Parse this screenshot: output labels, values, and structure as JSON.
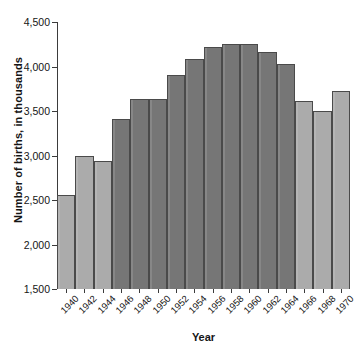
{
  "chart_data": {
    "type": "bar",
    "title": "",
    "xlabel": "Year",
    "ylabel": "Number of births, in thousands",
    "ylim": [
      1500,
      4500
    ],
    "ytick_labels": [
      "4,500",
      "4,000",
      "3,500",
      "3,000",
      "2,500",
      "2,000",
      "1,500"
    ],
    "ytick_values": [
      4500,
      4000,
      3500,
      3000,
      2500,
      2000,
      1500
    ],
    "grid": false,
    "legend": "none",
    "categories": [
      "1940",
      "1942",
      "1944",
      "1946",
      "1948",
      "1950",
      "1952",
      "1954",
      "1956",
      "1958",
      "1960",
      "1962",
      "1964",
      "1966",
      "1968",
      "1970"
    ],
    "values": [
      2560,
      2990,
      2940,
      3410,
      3640,
      3630,
      3910,
      4080,
      4220,
      4250,
      4250,
      4160,
      4030,
      3610,
      3500,
      3730
    ],
    "bar_shades": [
      "light",
      "light",
      "light",
      "dark",
      "dark",
      "dark",
      "dark",
      "dark",
      "dark",
      "dark",
      "dark",
      "dark",
      "dark",
      "light",
      "light",
      "light"
    ],
    "colors": {
      "bar_light": "#ababab",
      "bar_dark": "#767676",
      "bar_border": "#4a4a4a",
      "axis": "#3b3b3b",
      "text": "#151515",
      "background": "#ffffff"
    }
  }
}
